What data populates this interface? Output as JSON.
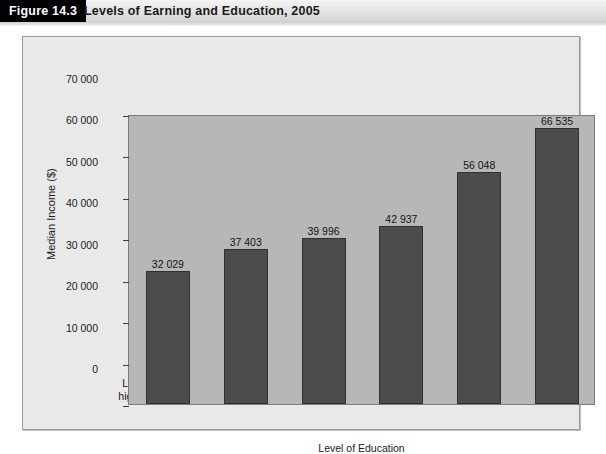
{
  "header": {
    "figure_tag": "Figure 14.3",
    "title": "Levels of Earning and Education, 2005"
  },
  "chart_data": {
    "type": "bar",
    "title": "Levels of Earning and Education, 2005",
    "xlabel": "Level of Education",
    "ylabel": "Median Income ($)",
    "ylim": [
      0,
      70000
    ],
    "ytick_values": [
      0,
      10000,
      20000,
      30000,
      40000,
      50000,
      60000,
      70000
    ],
    "ytick_labels": [
      "0",
      "10 000",
      "20 000",
      "30 000",
      "40 000",
      "50 000",
      "60 000",
      "70 000"
    ],
    "grid": false,
    "legend": "none",
    "categories": [
      "Less than high school",
      "High school",
      "Trades or apprenticeship",
      "College",
      "Bachelor's degree",
      "Graduate degree"
    ],
    "category_lines": [
      [
        "Less than",
        "high school"
      ],
      [
        "High school"
      ],
      [
        "Trades or",
        "apprenticeship"
      ],
      [
        "College"
      ],
      [
        "Bachelor's",
        "degree"
      ],
      [
        "Graduate",
        "degree"
      ]
    ],
    "values": [
      32029,
      37403,
      39996,
      42937,
      56048,
      66535
    ],
    "value_labels": [
      "32 029",
      "37 403",
      "39 996",
      "42 937",
      "56 048",
      "66 535"
    ],
    "bar_color": "#4c4c4c",
    "plot_background": "#b7b7b7",
    "panel_background": "#e9e9e9"
  }
}
